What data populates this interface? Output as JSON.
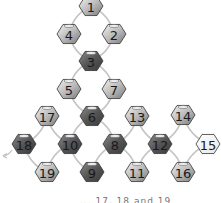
{
  "diagram": {
    "type": "node-graph",
    "colors": {
      "dark_fill": "#5a5a5a",
      "medium_fill": "#9a9a9a",
      "light_fill": "#f4f4f4",
      "edge": "#c4c4c4",
      "text": "#1a1a1a"
    },
    "nodes": [
      {
        "id": "1",
        "x": 91,
        "y": 6,
        "shade": "medium"
      },
      {
        "id": "4",
        "x": 69,
        "y": 34,
        "shade": "medium"
      },
      {
        "id": "2",
        "x": 114,
        "y": 34,
        "shade": "medium"
      },
      {
        "id": "3",
        "x": 91,
        "y": 61,
        "shade": "dark"
      },
      {
        "id": "5",
        "x": 69,
        "y": 89,
        "shade": "medium"
      },
      {
        "id": "7",
        "x": 114,
        "y": 89,
        "shade": "medium"
      },
      {
        "id": "6",
        "x": 92,
        "y": 116,
        "shade": "dark"
      },
      {
        "id": "17",
        "x": 47,
        "y": 116,
        "shade": "medium"
      },
      {
        "id": "13",
        "x": 137,
        "y": 116,
        "shade": "medium"
      },
      {
        "id": "14",
        "x": 183,
        "y": 115,
        "shade": "medium"
      },
      {
        "id": "18",
        "x": 24,
        "y": 144,
        "shade": "dark"
      },
      {
        "id": "10",
        "x": 70,
        "y": 144,
        "shade": "dark"
      },
      {
        "id": "8",
        "x": 115,
        "y": 144,
        "shade": "dark"
      },
      {
        "id": "12",
        "x": 160,
        "y": 144,
        "shade": "dark"
      },
      {
        "id": "15",
        "x": 208,
        "y": 144,
        "shade": "light"
      },
      {
        "id": "19",
        "x": 47,
        "y": 172,
        "shade": "medium"
      },
      {
        "id": "9",
        "x": 92,
        "y": 172,
        "shade": "dark"
      },
      {
        "id": "11",
        "x": 137,
        "y": 172,
        "shade": "medium"
      },
      {
        "id": "16",
        "x": 183,
        "y": 172,
        "shade": "medium"
      }
    ],
    "edges": [
      [
        "1",
        "4"
      ],
      [
        "1",
        "2"
      ],
      [
        "4",
        "3"
      ],
      [
        "2",
        "3"
      ],
      [
        "3",
        "5"
      ],
      [
        "3",
        "7"
      ],
      [
        "5",
        "6"
      ],
      [
        "7",
        "6"
      ],
      [
        "6",
        "10"
      ],
      [
        "6",
        "8"
      ],
      [
        "17",
        "10"
      ],
      [
        "17",
        "18"
      ],
      [
        "18",
        "19"
      ],
      [
        "19",
        "10"
      ],
      [
        "10",
        "9"
      ],
      [
        "9",
        "8"
      ],
      [
        "8",
        "13"
      ],
      [
        "8",
        "11"
      ],
      [
        "13",
        "12"
      ],
      [
        "11",
        "12"
      ],
      [
        "12",
        "14"
      ],
      [
        "12",
        "16"
      ],
      [
        "14",
        "15"
      ],
      [
        "16",
        "15"
      ]
    ],
    "caption": "... 17, 18 and 19"
  }
}
